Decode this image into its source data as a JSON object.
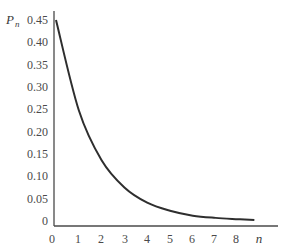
{
  "chart_data": {
    "type": "line",
    "title": "",
    "xlabel": "n",
    "ylabel": "P_n",
    "ylabel_main": "P",
    "ylabel_sub": "n",
    "x_ticks": [
      "0",
      "1",
      "2",
      "3",
      "4",
      "5",
      "6",
      "7",
      "8"
    ],
    "y_ticks": [
      "0",
      "0.05",
      "0.10",
      "0.15",
      "0.20",
      "0.25",
      "0.30",
      "0.35",
      "0.40",
      "0.45"
    ],
    "xlim": [
      0,
      9.3
    ],
    "ylim": [
      0,
      0.47
    ],
    "grid": false,
    "legend": null,
    "series": [
      {
        "name": "P_n",
        "x": [
          0,
          1,
          2,
          3,
          4,
          5,
          6,
          7,
          8,
          8.7
        ],
        "values": [
          0.45,
          0.248,
          0.136,
          0.075,
          0.041,
          0.023,
          0.012,
          0.007,
          0.004,
          0.002
        ]
      }
    ],
    "line_color": "#2e2e2e",
    "axis_color": "#4a4a4a"
  }
}
